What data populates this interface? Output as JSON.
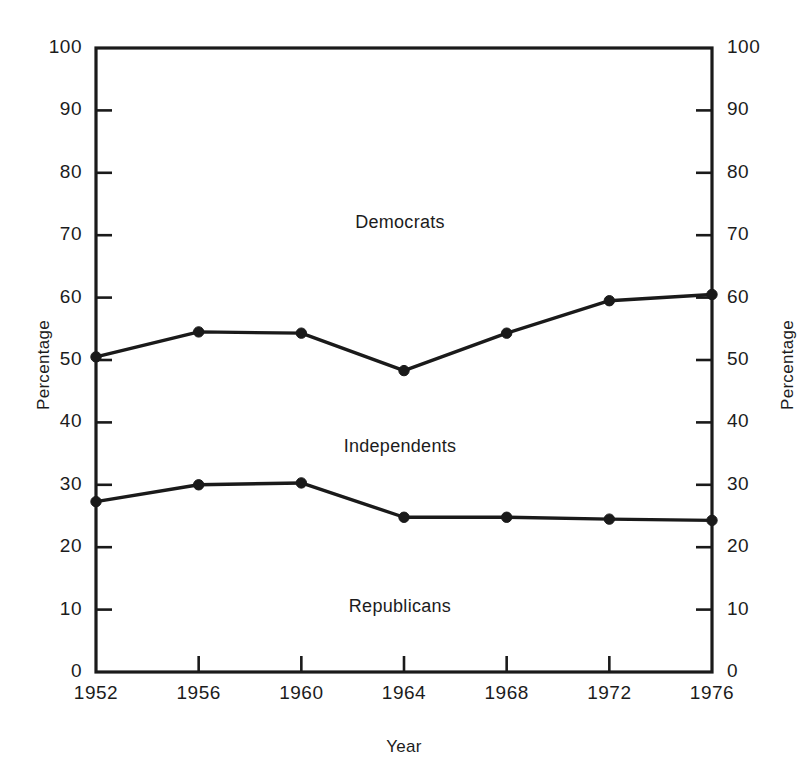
{
  "chart_data": {
    "type": "line",
    "title": "",
    "xlabel": "Year",
    "ylabel": "Percentage",
    "ylabel_right": "Percentage",
    "categories": [
      1952,
      1956,
      1960,
      1964,
      1968,
      1972,
      1976
    ],
    "x_tick_labels": [
      "1952",
      "1956",
      "1960",
      "1964",
      "1968",
      "1972",
      "1976"
    ],
    "y_tick_labels": [
      "100",
      "90",
      "80",
      "70",
      "60",
      "50",
      "40",
      "30",
      "20",
      "10",
      "0"
    ],
    "y_tick_values": [
      100,
      90,
      80,
      70,
      60,
      50,
      40,
      30,
      20,
      10,
      0
    ],
    "ylim": [
      0,
      100
    ],
    "grid": false,
    "legend_position": "inline-annotations",
    "series": [
      {
        "name": "Democrats",
        "note": "upper cumulative boundary line",
        "values": [
          50.5,
          54.5,
          54.3,
          48.3,
          54.3,
          59.5,
          60.5
        ]
      },
      {
        "name": "Republicans",
        "note": "lower cumulative boundary line",
        "values": [
          27.3,
          30.0,
          30.3,
          24.8,
          24.8,
          24.5,
          24.3
        ]
      }
    ],
    "annotations": [
      {
        "text": "Democrats",
        "x_pixel": 400,
        "y_pixel": 224
      },
      {
        "text": "Independents",
        "x_pixel": 400,
        "y_pixel": 448
      },
      {
        "text": "Republicans",
        "x_pixel": 400,
        "y_pixel": 608
      }
    ],
    "band_labels": [
      "Democrats",
      "Independents",
      "Republicans"
    ],
    "colors": {
      "line": "#1a1a1a",
      "axis": "#1a1a1a",
      "background": "#ffffff",
      "text": "#1c1c1c"
    }
  },
  "axes": {
    "left": {
      "label": "Percentage",
      "ticks": [
        {
          "label": "100",
          "value": 100
        },
        {
          "label": "90",
          "value": 90
        },
        {
          "label": "80",
          "value": 80
        },
        {
          "label": "70",
          "value": 70
        },
        {
          "label": "60",
          "value": 60
        },
        {
          "label": "50",
          "value": 50
        },
        {
          "label": "40",
          "value": 40
        },
        {
          "label": "30",
          "value": 30
        },
        {
          "label": "20",
          "value": 20
        },
        {
          "label": "10",
          "value": 10
        },
        {
          "label": "0",
          "value": 0
        }
      ]
    },
    "right": {
      "label": "Percentage",
      "ticks": [
        {
          "label": "100",
          "value": 100
        },
        {
          "label": "90",
          "value": 90
        },
        {
          "label": "80",
          "value": 80
        },
        {
          "label": "70",
          "value": 70
        },
        {
          "label": "60",
          "value": 60
        },
        {
          "label": "50",
          "value": 50
        },
        {
          "label": "40",
          "value": 40
        },
        {
          "label": "30",
          "value": 30
        },
        {
          "label": "20",
          "value": 20
        },
        {
          "label": "10",
          "value": 10
        },
        {
          "label": "0",
          "value": 0
        }
      ]
    },
    "bottom": {
      "label": "Year",
      "ticks": [
        {
          "label": "1952"
        },
        {
          "label": "1956"
        },
        {
          "label": "1960"
        },
        {
          "label": "1964"
        },
        {
          "label": "1968"
        },
        {
          "label": "1972"
        },
        {
          "label": "1976"
        }
      ]
    }
  }
}
